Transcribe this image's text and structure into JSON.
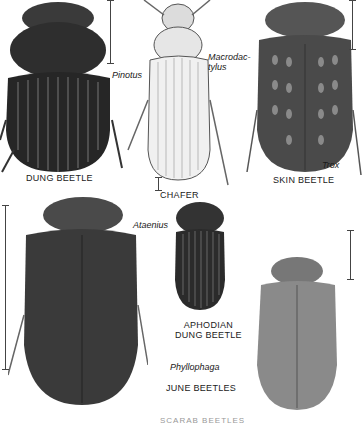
{
  "plate": {
    "labels": {
      "dung_beetle": "DUNG BEETLE",
      "chafer": "CHAFER",
      "skin_beetle": "SKIN BEETLE",
      "aphodian": "APHODIAN\nDUNG BEETLE",
      "june_beetles": "JUNE BEETLES"
    },
    "genera": {
      "pinotus": "Pinotus",
      "macrodactylus": "Macrodac-\ntylus",
      "trox": "Trox",
      "ataenius": "Ataenius",
      "phyllophaga": "Phyllophaga"
    },
    "cut_caption": "SCARAB BEETLES",
    "colors": {
      "ink": "#1a1a1a",
      "dark_beetle": "#2b2b2b",
      "mid_beetle": "#5a5a5a",
      "light_beetle": "#e8e8e8",
      "paper": "#ffffff"
    }
  }
}
